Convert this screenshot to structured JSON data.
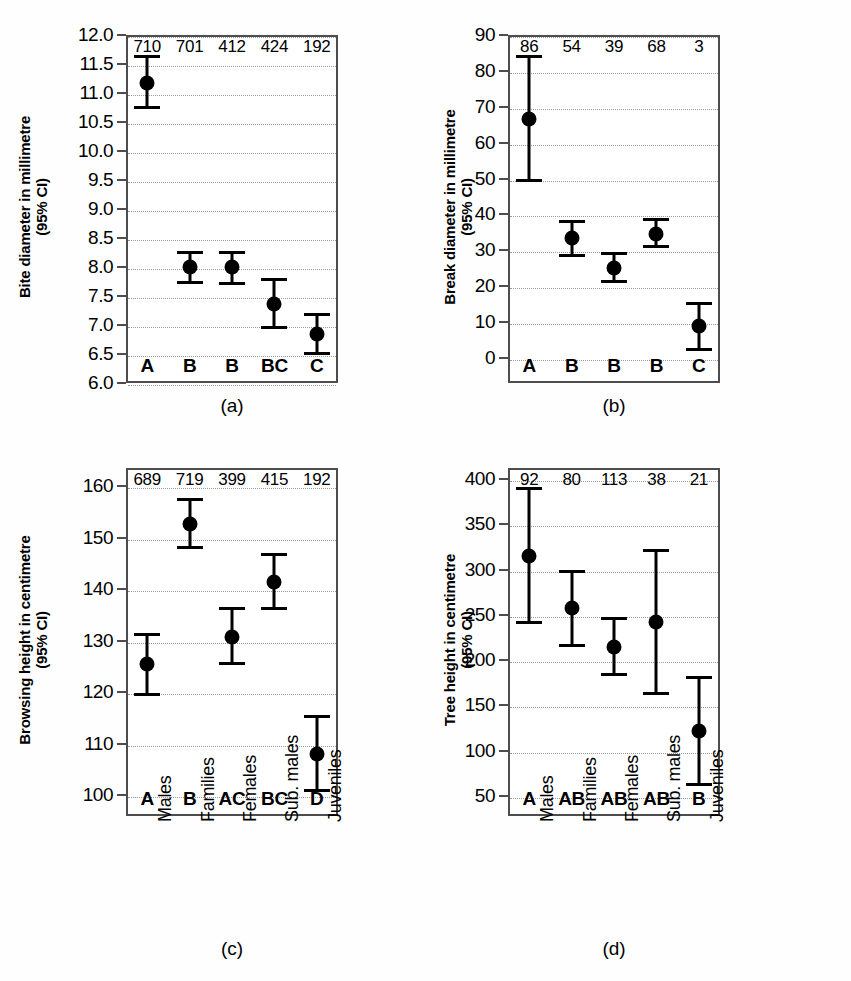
{
  "figure": {
    "background": "#fefefe",
    "marker_color": "#000000",
    "frame_color": "#4d4d4d",
    "grid_color": "#9a9a9a"
  },
  "chart_data": [
    {
      "id": "a",
      "type": "scatter",
      "title": "",
      "caption": "(a)",
      "ylabel_line1": "Bite diameter in millimetre",
      "ylabel_line2": "(95% CI)",
      "xlabel": "",
      "categories": [
        "Males",
        "Families",
        "Females",
        "Sub. males",
        "Juveniles"
      ],
      "show_category_labels": false,
      "group_letters": [
        "A",
        "B",
        "B",
        "BC",
        "C"
      ],
      "counts": [
        "710",
        "701",
        "412",
        "424",
        "192"
      ],
      "ylim": [
        6.0,
        12.0
      ],
      "yticks": [
        6.0,
        6.5,
        7.0,
        7.5,
        8.0,
        8.5,
        9.0,
        9.5,
        10.0,
        10.5,
        11.0,
        11.5,
        12.0
      ],
      "ytick_labels": [
        "6.0",
        "6.5",
        "7.0",
        "7.5",
        "8.0",
        "8.5",
        "9.0",
        "9.5",
        "10.0",
        "10.5",
        "11.0",
        "11.5",
        "12.0"
      ],
      "grid": true,
      "values": [
        11.18,
        8.0,
        8.0,
        7.37,
        6.85
      ],
      "ci_low": [
        10.72,
        7.7,
        7.69,
        6.93,
        6.48
      ],
      "ci_high": [
        11.65,
        8.28,
        8.28,
        7.81,
        7.21
      ]
    },
    {
      "id": "b",
      "type": "scatter",
      "title": "",
      "caption": "(b)",
      "ylabel_line1": "Break diameter in millimetre",
      "ylabel_line2": "(95% CI)",
      "xlabel": "",
      "categories": [
        "Males",
        "Families",
        "Females",
        "Sub. males",
        "Juveniles"
      ],
      "show_category_labels": false,
      "group_letters": [
        "A",
        "B",
        "B",
        "B",
        "C"
      ],
      "counts": [
        "86",
        "54",
        "39",
        "68",
        "3"
      ],
      "ylim": [
        -7,
        90
      ],
      "yticks": [
        0,
        10,
        20,
        30,
        40,
        50,
        60,
        70,
        80,
        90
      ],
      "ytick_labels": [
        "0",
        "10",
        "20",
        "30",
        "40",
        "50",
        "60",
        "70",
        "80",
        "90"
      ],
      "grid": true,
      "values": [
        66.5,
        33.5,
        25.0,
        34.5,
        8.8
      ],
      "ci_low": [
        49.0,
        28.2,
        21.0,
        30.5,
        2.0
      ],
      "ci_high": [
        84.5,
        38.5,
        29.5,
        39.0,
        15.5
      ]
    },
    {
      "id": "c",
      "type": "scatter",
      "title": "",
      "caption": "(c)",
      "ylabel_line1": "Browsing height in centimetre",
      "ylabel_line2": "(95% CI)",
      "xlabel": "",
      "categories": [
        "Males",
        "Families",
        "Females",
        "Sub. males",
        "Juveniles"
      ],
      "show_category_labels": true,
      "group_letters": [
        "A",
        "B",
        "AC",
        "BC",
        "D"
      ],
      "counts": [
        "689",
        "719",
        "399",
        "415",
        "192"
      ],
      "ylim": [
        96,
        163.5
      ],
      "yticks": [
        100,
        110,
        120,
        130,
        140,
        150,
        160
      ],
      "ytick_labels": [
        "100",
        "110",
        "120",
        "130",
        "140",
        "150",
        "160"
      ],
      "grid": true,
      "values": [
        125.4,
        152.7,
        130.8,
        141.3,
        108.0
      ],
      "ci_low": [
        119.3,
        147.8,
        125.2,
        136.0,
        100.6
      ],
      "ci_high": [
        131.5,
        157.7,
        136.5,
        147.0,
        115.5
      ]
    },
    {
      "id": "d",
      "type": "scatter",
      "title": "",
      "caption": "(d)",
      "ylabel_line1": "Tree height in centimetre",
      "ylabel_line2": "(95% CI)",
      "xlabel": "",
      "categories": [
        "Males",
        "Families",
        "Females",
        "Sub. males",
        "Juveniles"
      ],
      "show_category_labels": true,
      "group_letters": [
        "A",
        "AB",
        "AB",
        "AB",
        "B"
      ],
      "counts": [
        "92",
        "80",
        "113",
        "38",
        "21"
      ],
      "ylim": [
        28,
        412
      ],
      "yticks": [
        50,
        100,
        150,
        200,
        250,
        300,
        350,
        400
      ],
      "ytick_labels": [
        "50",
        "100",
        "150",
        "200",
        "250",
        "300",
        "350",
        "400"
      ],
      "grid": true,
      "values": [
        315.0,
        257.0,
        215.0,
        242.0,
        122.0
      ],
      "ci_low": [
        240.0,
        215.0,
        182.0,
        161.0,
        61.0
      ],
      "ci_high": [
        391.0,
        299.0,
        248.0,
        323.0,
        183.0
      ]
    }
  ]
}
